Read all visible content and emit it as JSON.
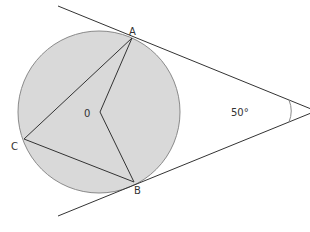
{
  "diagram": {
    "type": "circle-tangent-geometry",
    "colors": {
      "circle_fill": "#d9d9d9",
      "circle_stroke": "#8a8a8a",
      "line": "#333333",
      "label": "#333333",
      "background": "#ffffff"
    },
    "circle": {
      "cx": 99,
      "cy": 112,
      "r": 81
    },
    "points": {
      "A": {
        "x": 132,
        "y": 38,
        "label": "A"
      },
      "B": {
        "x": 134,
        "y": 182,
        "label": "B"
      },
      "C": {
        "x": 24,
        "y": 139,
        "label": "C"
      },
      "O": {
        "x": 100,
        "y": 112,
        "label": "0"
      },
      "T": {
        "x": 316,
        "y": 111,
        "label": "T"
      }
    },
    "angle_label": "50°",
    "segments": [
      {
        "from": "A",
        "to": "C"
      },
      {
        "from": "C",
        "to": "B"
      },
      {
        "from": "A",
        "to": "O"
      },
      {
        "from": "O",
        "to": "B"
      },
      {
        "from": "A",
        "to": "T"
      },
      {
        "from": "B",
        "to": "T"
      }
    ],
    "labels": {
      "A": "A",
      "B": "B",
      "C": "C",
      "O": "0",
      "T": "T",
      "angle": "50°"
    }
  }
}
